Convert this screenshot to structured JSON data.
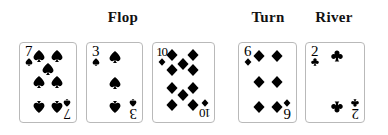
{
  "board": {
    "title": "Poker community board",
    "streets": [
      {
        "name": "flop",
        "label": "Flop"
      },
      {
        "name": "turn",
        "label": "Turn"
      },
      {
        "name": "river",
        "label": "River"
      }
    ],
    "cards": [
      {
        "name": "card-seven-of-spades",
        "street": "flop",
        "rank": "7",
        "rank_display": "7",
        "suit": "spade",
        "suit_symbol": "♠",
        "color": "#000000",
        "pip_count": 7,
        "pip_layout": [
          {
            "x": 22,
            "y": 13,
            "flip": false
          },
          {
            "x": 78,
            "y": 13,
            "flip": false
          },
          {
            "x": 50,
            "y": 31,
            "flip": false
          },
          {
            "x": 22,
            "y": 49,
            "flip": false
          },
          {
            "x": 78,
            "y": 49,
            "flip": false
          },
          {
            "x": 22,
            "y": 85,
            "flip": true
          },
          {
            "x": 78,
            "y": 85,
            "flip": true
          }
        ]
      },
      {
        "name": "card-three-of-spades",
        "street": "flop",
        "rank": "3",
        "rank_display": "3",
        "suit": "spade",
        "suit_symbol": "♠",
        "color": "#000000",
        "pip_count": 3,
        "pip_layout": [
          {
            "x": 52,
            "y": 14,
            "flip": false
          },
          {
            "x": 52,
            "y": 50,
            "flip": false
          },
          {
            "x": 52,
            "y": 85,
            "flip": true
          }
        ]
      },
      {
        "name": "card-ten-of-diamonds",
        "street": "flop",
        "rank": "10",
        "rank_display": "10",
        "suit": "diamond",
        "suit_symbol": "♦",
        "color": "#000000",
        "pip_count": 10,
        "pip_layout": [
          {
            "x": 20,
            "y": 11,
            "flip": false
          },
          {
            "x": 76,
            "y": 11,
            "flip": false
          },
          {
            "x": 48,
            "y": 24,
            "flip": false
          },
          {
            "x": 20,
            "y": 32,
            "flip": false
          },
          {
            "x": 76,
            "y": 32,
            "flip": false
          },
          {
            "x": 20,
            "y": 58,
            "flip": true
          },
          {
            "x": 76,
            "y": 58,
            "flip": true
          },
          {
            "x": 48,
            "y": 68,
            "flip": true
          },
          {
            "x": 20,
            "y": 82,
            "flip": true
          },
          {
            "x": 76,
            "y": 82,
            "flip": true
          }
        ]
      },
      {
        "name": "card-six-of-diamonds",
        "street": "turn",
        "rank": "6",
        "rank_display": "6",
        "suit": "diamond",
        "suit_symbol": "♦",
        "color": "#000000",
        "pip_count": 6,
        "pip_layout": [
          {
            "x": 23,
            "y": 13,
            "flip": false
          },
          {
            "x": 79,
            "y": 13,
            "flip": false
          },
          {
            "x": 23,
            "y": 49,
            "flip": false
          },
          {
            "x": 79,
            "y": 49,
            "flip": false
          },
          {
            "x": 23,
            "y": 85,
            "flip": true
          },
          {
            "x": 79,
            "y": 85,
            "flip": true
          }
        ]
      },
      {
        "name": "card-two-of-clubs",
        "street": "river",
        "rank": "2",
        "rank_display": "2",
        "suit": "club",
        "suit_symbol": "♣",
        "color": "#000000",
        "pip_count": 2,
        "pip_layout": [
          {
            "x": 56,
            "y": 13,
            "flip": false
          },
          {
            "x": 56,
            "y": 85,
            "flip": true
          }
        ]
      }
    ]
  },
  "style": {
    "background": "#ffffff",
    "ink": "#000000",
    "card_border": "#b9b9b9",
    "card_face": "#ffffff"
  }
}
